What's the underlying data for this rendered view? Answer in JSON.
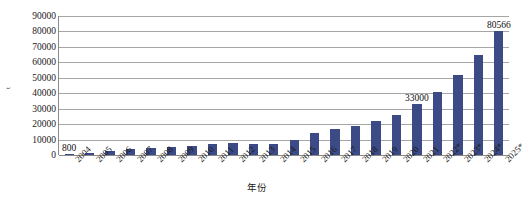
{
  "chart_data": {
    "type": "bar",
    "title": "",
    "subtitle": "",
    "xlabel": "年份",
    "ylabel": "t",
    "categories": [
      "2004",
      "2005",
      "2006",
      "2007",
      "2008",
      "2009",
      "2010",
      "2011",
      "2012",
      "2013",
      "2014",
      "2015",
      "2016",
      "2017",
      "2018",
      "2019",
      "2020",
      "2021",
      "2022*",
      "2023*",
      "2024*",
      "2025*"
    ],
    "values": [
      800,
      1500,
      2600,
      3900,
      4400,
      5400,
      6100,
      7200,
      7900,
      6900,
      7400,
      9800,
      14500,
      16600,
      18700,
      21800,
      25800,
      33000,
      40500,
      51500,
      64500,
      80566
    ],
    "series": [
      {
        "name": "产量",
        "values": [
          800,
          1500,
          2600,
          3900,
          4400,
          5400,
          6100,
          7200,
          7900,
          6900,
          7400,
          9800,
          14500,
          16600,
          18700,
          21800,
          25800,
          33000,
          40500,
          51500,
          64500,
          80566
        ]
      }
    ],
    "point_labels": [
      {
        "category": "2004",
        "text": "800"
      },
      {
        "category": "2021",
        "text": "33000"
      },
      {
        "category": "2025*",
        "text": "80566"
      }
    ],
    "yticks": [
      0,
      10000,
      20000,
      30000,
      40000,
      50000,
      60000,
      70000,
      80000,
      90000
    ],
    "ytick_labels": [
      "0",
      "10000",
      "20000",
      "30000",
      "40000",
      "50000",
      "60000",
      "70000",
      "80000",
      "90000"
    ],
    "ylim": [
      0,
      90000
    ],
    "grid": true,
    "legend": null,
    "legend_position": "none",
    "bar_color": "#3c4a85",
    "gridline_color": "#a6a6a6",
    "axis_color": "#8a8a8a",
    "background_color": "#ffffff"
  }
}
